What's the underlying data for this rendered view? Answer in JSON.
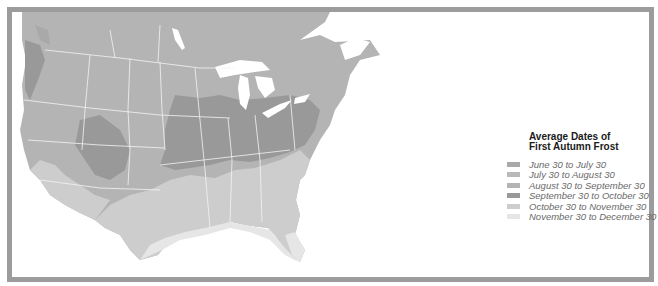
{
  "map": {
    "region": "Contiguous United States and southern Canada",
    "subject": "First autumn frost zones"
  },
  "legend": {
    "title_line1": "Average Dates of",
    "title_line2": "First Autumn Frost",
    "items": [
      {
        "label": "June 30 to July 30",
        "color": "#a9a9a9"
      },
      {
        "label": "July 30 to August 30",
        "color": "#b9b9b9"
      },
      {
        "label": "August 30 to September 30",
        "color": "#b4b4b4"
      },
      {
        "label": "September 30 to October 30",
        "color": "#999999"
      },
      {
        "label": "October 30 to November 30",
        "color": "#cdcdcd"
      },
      {
        "label": "November 30 to December 30",
        "color": "#e6e6e6"
      }
    ]
  },
  "colors": {
    "frame": "#9c9c9c",
    "water": "#ffffff",
    "borders": "#f4f4f4"
  }
}
